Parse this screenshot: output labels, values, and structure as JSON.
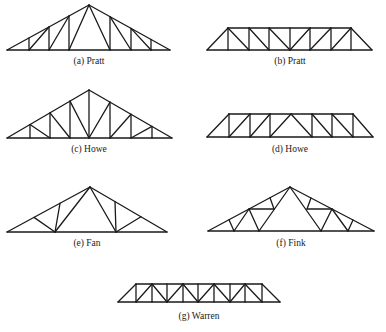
{
  "figure": {
    "trusses": [
      {
        "id": "a",
        "caption": "(a) Pratt",
        "name": "Pratt",
        "kind": "roof"
      },
      {
        "id": "b",
        "caption": "(b) Pratt",
        "name": "Pratt",
        "kind": "bridge"
      },
      {
        "id": "c",
        "caption": "(c) Howe",
        "name": "Howe",
        "kind": "roof"
      },
      {
        "id": "d",
        "caption": "(d) Howe",
        "name": "Howe",
        "kind": "bridge"
      },
      {
        "id": "e",
        "caption": "(e) Fan",
        "name": "Fan",
        "kind": "roof"
      },
      {
        "id": "f",
        "caption": "(f) Fink",
        "name": "Fink",
        "kind": "roof"
      },
      {
        "id": "g",
        "caption": "(g) Warren",
        "name": "Warren",
        "kind": "bridge"
      }
    ]
  }
}
